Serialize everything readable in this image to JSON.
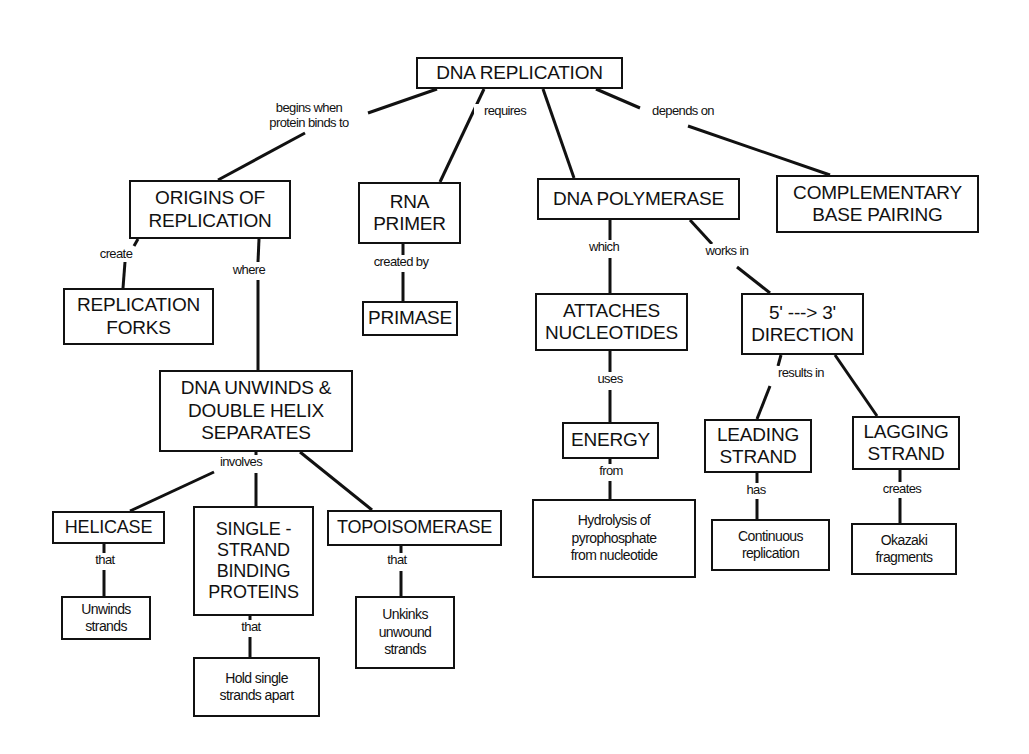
{
  "diagram": {
    "type": "concept-map",
    "title": "DNA REPLICATION",
    "nodes": [
      {
        "id": "dna_replication",
        "label": "DNA REPLICATION",
        "x": 416,
        "y": 57,
        "w": 207,
        "h": 32,
        "size": "big"
      },
      {
        "id": "origins",
        "label": "ORIGINS OF\nREPLICATION",
        "x": 129,
        "y": 180,
        "w": 162,
        "h": 59,
        "size": "big"
      },
      {
        "id": "rna_primer",
        "label": "RNA\nPRIMER",
        "x": 358,
        "y": 182,
        "w": 103,
        "h": 62,
        "size": "big"
      },
      {
        "id": "dna_polymerase",
        "label": "DNA POLYMERASE",
        "x": 537,
        "y": 178,
        "w": 203,
        "h": 42,
        "size": "big"
      },
      {
        "id": "complementary",
        "label": "COMPLEMENTARY\nBASE PAIRING",
        "x": 776,
        "y": 175,
        "w": 203,
        "h": 58,
        "size": "big"
      },
      {
        "id": "replication_forks",
        "label": "REPLICATION\nFORKS",
        "x": 63,
        "y": 288,
        "w": 151,
        "h": 57,
        "size": "big"
      },
      {
        "id": "primase",
        "label": "PRIMASE",
        "x": 362,
        "y": 301,
        "w": 96,
        "h": 35,
        "size": "big"
      },
      {
        "id": "attaches",
        "label": "ATTACHES\nNUCLEOTIDES",
        "x": 535,
        "y": 293,
        "w": 153,
        "h": 58,
        "size": "big"
      },
      {
        "id": "direction",
        "label": "5' ---> 3'\nDIRECTION",
        "x": 741,
        "y": 293,
        "w": 123,
        "h": 62,
        "size": "big"
      },
      {
        "id": "dna_unwinds",
        "label": "DNA UNWINDS &\nDOUBLE HELIX\nSEPARATES",
        "x": 159,
        "y": 370,
        "w": 194,
        "h": 82,
        "size": "big"
      },
      {
        "id": "energy",
        "label": "ENERGY",
        "x": 562,
        "y": 422,
        "w": 97,
        "h": 37,
        "size": "big"
      },
      {
        "id": "leading",
        "label": "LEADING\nSTRAND",
        "x": 704,
        "y": 419,
        "w": 108,
        "h": 54,
        "size": "big"
      },
      {
        "id": "lagging",
        "label": "LAGGING\nSTRAND",
        "x": 852,
        "y": 416,
        "w": 108,
        "h": 54,
        "size": "big"
      },
      {
        "id": "helicase",
        "label": "HELICASE",
        "x": 52,
        "y": 511,
        "w": 113,
        "h": 33,
        "size": "mid"
      },
      {
        "id": "ssb",
        "label": "SINGLE -\nSTRAND\nBINDING\nPROTEINS",
        "x": 193,
        "y": 506,
        "w": 121,
        "h": 110,
        "size": "mid"
      },
      {
        "id": "topoisomerase",
        "label": "TOPOISOMERASE",
        "x": 327,
        "y": 510,
        "w": 175,
        "h": 36,
        "size": "mid"
      },
      {
        "id": "hydrolysis",
        "label": "Hydrolysis of\npyrophosphate\nfrom nucleotide",
        "x": 532,
        "y": 499,
        "w": 164,
        "h": 79,
        "size": "small"
      },
      {
        "id": "continuous",
        "label": "Continuous\nreplication",
        "x": 711,
        "y": 519,
        "w": 119,
        "h": 52,
        "size": "small"
      },
      {
        "id": "okazaki",
        "label": "Okazaki\nfragments",
        "x": 851,
        "y": 523,
        "w": 106,
        "h": 52,
        "size": "small"
      },
      {
        "id": "unwinds_strands",
        "label": "Unwinds\nstrands",
        "x": 61,
        "y": 596,
        "w": 90,
        "h": 44,
        "size": "small"
      },
      {
        "id": "unkinks",
        "label": "Unkinks\nunwound\nstrands",
        "x": 355,
        "y": 596,
        "w": 100,
        "h": 73,
        "size": "small"
      },
      {
        "id": "hold_single",
        "label": "Hold single\nstrands apart",
        "x": 193,
        "y": 657,
        "w": 127,
        "h": 60,
        "size": "small"
      }
    ],
    "links": [
      {
        "label": "begins when\nprotein binds to",
        "x": 253,
        "y": 101,
        "w": 110
      },
      {
        "label": "requires",
        "x": 474,
        "y": 104,
        "w": 60
      },
      {
        "label": "depends on",
        "x": 642,
        "y": 104,
        "w": 80
      },
      {
        "label": "create",
        "x": 90,
        "y": 247,
        "w": 50
      },
      {
        "label": "where",
        "x": 226,
        "y": 263,
        "w": 44
      },
      {
        "label": "created by",
        "x": 364,
        "y": 255,
        "w": 72
      },
      {
        "label": "which",
        "x": 581,
        "y": 240,
        "w": 44
      },
      {
        "label": "works in",
        "x": 696,
        "y": 244,
        "w": 60
      },
      {
        "label": "uses",
        "x": 591,
        "y": 372,
        "w": 36
      },
      {
        "label": "results in",
        "x": 768,
        "y": 366,
        "w": 64
      },
      {
        "label": "involves",
        "x": 212,
        "y": 455,
        "w": 56
      },
      {
        "label": "from",
        "x": 593,
        "y": 464,
        "w": 34
      },
      {
        "label": "has",
        "x": 741,
        "y": 483,
        "w": 28
      },
      {
        "label": "creates",
        "x": 875,
        "y": 482,
        "w": 52
      },
      {
        "label": "that",
        "x": 88,
        "y": 553,
        "w": 32
      },
      {
        "label": "that",
        "x": 380,
        "y": 553,
        "w": 32
      },
      {
        "label": "that",
        "x": 234,
        "y": 620,
        "w": 32
      }
    ],
    "edges": [
      [
        437,
        89,
        368,
        113
      ],
      [
        305,
        133,
        218,
        180
      ],
      [
        484,
        89,
        440,
        182
      ],
      [
        543,
        89,
        574,
        178
      ],
      [
        596,
        89,
        640,
        108
      ],
      [
        688,
        126,
        830,
        175
      ],
      [
        138,
        239,
        134,
        246
      ],
      [
        125,
        262,
        123,
        288
      ],
      [
        259,
        239,
        258,
        262
      ],
      [
        258,
        280,
        258,
        370
      ],
      [
        403,
        244,
        403,
        255
      ],
      [
        403,
        272,
        403,
        301
      ],
      [
        610,
        220,
        610,
        240
      ],
      [
        610,
        258,
        610,
        293
      ],
      [
        690,
        220,
        712,
        244
      ],
      [
        737,
        267,
        770,
        293
      ],
      [
        610,
        351,
        610,
        372
      ],
      [
        610,
        390,
        610,
        422
      ],
      [
        781,
        355,
        778,
        366
      ],
      [
        770,
        386,
        757,
        419
      ],
      [
        835,
        355,
        877,
        416
      ],
      [
        256,
        452,
        256,
        457
      ],
      [
        256,
        473,
        256,
        506
      ],
      [
        214,
        472,
        130,
        511
      ],
      [
        300,
        452,
        372,
        510
      ],
      [
        610,
        459,
        610,
        464
      ],
      [
        610,
        481,
        610,
        499
      ],
      [
        757,
        473,
        757,
        483
      ],
      [
        757,
        499,
        757,
        519
      ],
      [
        900,
        470,
        900,
        482
      ],
      [
        900,
        498,
        900,
        523
      ],
      [
        104,
        544,
        104,
        553
      ],
      [
        104,
        570,
        104,
        596
      ],
      [
        401,
        546,
        401,
        553
      ],
      [
        401,
        571,
        401,
        596
      ],
      [
        250,
        616,
        250,
        620
      ],
      [
        250,
        637,
        250,
        657
      ]
    ],
    "stroke": "#111111",
    "background": "#ffffff"
  }
}
